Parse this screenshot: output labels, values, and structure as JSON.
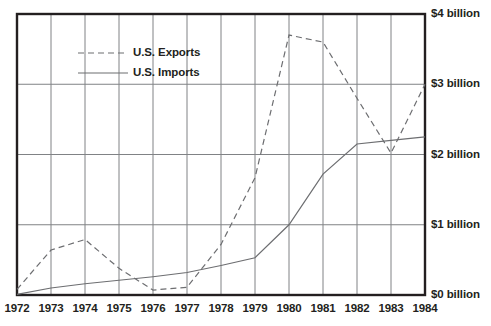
{
  "chart_data": {
    "type": "line",
    "title": "",
    "subtitle": "",
    "xlabel": "",
    "ylabel": "",
    "grid": true,
    "legend_position": "upper-left-inside",
    "x": [
      1972,
      1973,
      1974,
      1975,
      1976,
      1977,
      1978,
      1979,
      1980,
      1981,
      1982,
      1983,
      1984
    ],
    "xticklabels": [
      "1972",
      "1973",
      "1974",
      "1975",
      "1976",
      "1977",
      "1978",
      "1979",
      "1980",
      "1981",
      "1982",
      "1983",
      "1984"
    ],
    "xlim": [
      1972,
      1984
    ],
    "ylim": [
      0,
      4
    ],
    "yticks": [
      0,
      1,
      2,
      3,
      4
    ],
    "yticklabels": [
      "$0 billion",
      "$1 billion",
      "$2 billion",
      "$3 billion",
      "$4 billion"
    ],
    "y_unit": "billion USD",
    "series": [
      {
        "name": "U.S. Exports",
        "style": "dashed",
        "color": "#6d6e71",
        "values": [
          0.08,
          0.64,
          0.79,
          0.38,
          0.07,
          0.11,
          0.72,
          1.67,
          3.7,
          3.6,
          2.8,
          2.02,
          3.0
        ]
      },
      {
        "name": "U.S. Imports",
        "style": "solid",
        "color": "#6d6e71",
        "values": [
          0.01,
          0.1,
          0.16,
          0.21,
          0.26,
          0.32,
          0.42,
          0.53,
          1.0,
          1.72,
          2.15,
          2.2,
          2.25
        ]
      }
    ]
  },
  "legend": {
    "items": [
      {
        "label": "U.S. Exports",
        "style": "dashed"
      },
      {
        "label": "U.S. Imports",
        "style": "solid"
      }
    ]
  },
  "axes": {
    "y_tick_labels": [
      "$4 billion",
      "$3 billion",
      "$2 billion",
      "$1 billion",
      "$0 billion"
    ],
    "x_tick_labels": [
      "1972",
      "1973",
      "1974",
      "1975",
      "1976",
      "1977",
      "1978",
      "1979",
      "1980",
      "1981",
      "1982",
      "1983",
      "1984"
    ]
  },
  "colors": {
    "line": "#6d6e71",
    "grid": "#808285",
    "border": "#231f20",
    "text": "#231f20",
    "background": "#ffffff"
  }
}
